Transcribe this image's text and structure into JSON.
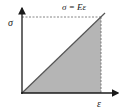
{
  "diagram": {
    "equation_label": "σ = Eε",
    "y_axis_label": "σ",
    "x_axis_label": "ε",
    "colors": {
      "axis": "#1a1a1a",
      "line": "#555555",
      "fill": "#b5b5b5",
      "dashed": "#666666"
    }
  }
}
